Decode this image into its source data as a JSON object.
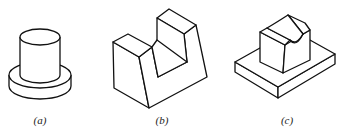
{
  "figure": {
    "panels": [
      {
        "id": "a",
        "label": "(a)",
        "description": "cylinder on circular base disc"
      },
      {
        "id": "b",
        "label": "(b)",
        "description": "U-shaped block with rectangular slot"
      },
      {
        "id": "c",
        "label": "(c)",
        "description": "saddle block on rectangular base plate"
      }
    ],
    "stroke_color": "#111111",
    "background": "#ffffff"
  }
}
